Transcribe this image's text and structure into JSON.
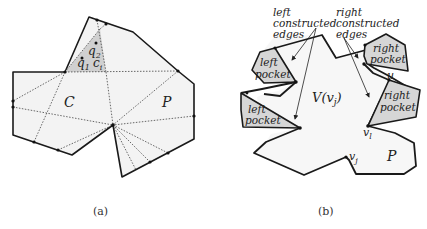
{
  "panel_a": {
    "caption": "(a)",
    "labels": {
      "C": "C",
      "P": "P",
      "q1": "q",
      "q1_sub": "1",
      "q2": "q",
      "q2_sub": "2",
      "ci": "c",
      "ci_sub": "i"
    }
  },
  "panel_b": {
    "caption": "(b)",
    "annotations": {
      "left_edges_line1": "left",
      "left_edges_line2": "constructed",
      "left_edges_line3": "edges",
      "right_edges_line1": "right",
      "right_edges_line2": "constructed",
      "right_edges_line3": "edges"
    },
    "pockets": {
      "left_top_l1": "left",
      "left_top_l2": "pocket",
      "left_bottom_l1": "left",
      "left_bottom_l2": "pocket",
      "right_top_l1": "right",
      "right_top_l2": "pocket",
      "right_bottom_l1": "right",
      "right_bottom_l2": "pocket"
    },
    "labels": {
      "V": "V(v",
      "V_sub": "j",
      "V_close": ")",
      "u": "u",
      "vl": "v",
      "vl_sub": "l",
      "vj": "v",
      "vj_sub": "j",
      "P": "P"
    }
  },
  "colors": {
    "polygon_fill": "#f3f3f3",
    "pocket_fill": "#d6d6d6",
    "edge": "#1a1a1a"
  }
}
